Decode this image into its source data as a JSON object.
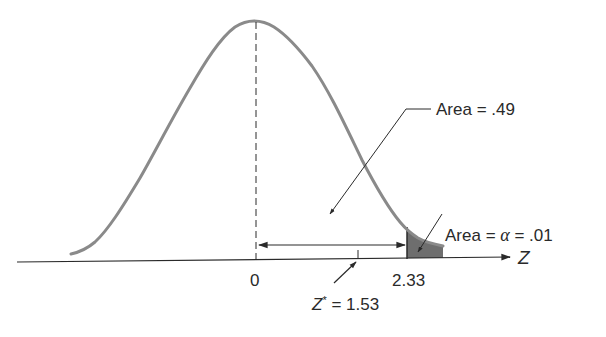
{
  "figure": {
    "type": "normal-distribution-hypothesis-test",
    "axis_label": "Z",
    "ticks": [
      {
        "label": "0",
        "value": 0
      },
      {
        "label": "2.33",
        "value": 2.33
      }
    ],
    "annotations": {
      "area_center": {
        "label": "Area = .49",
        "value": 0.49
      },
      "area_tail": {
        "prefix": "Area = ",
        "symbol": "α",
        "suffix": " = .01",
        "value": 0.01
      },
      "z_star": {
        "symbol": "Z",
        "sup": "*",
        "suffix": " = 1.53",
        "value": 1.53
      }
    },
    "colors": {
      "curve": "#8a8a8a",
      "lines": "#2a2a2a",
      "shade": "#6e6e6e",
      "background": "#ffffff"
    }
  }
}
